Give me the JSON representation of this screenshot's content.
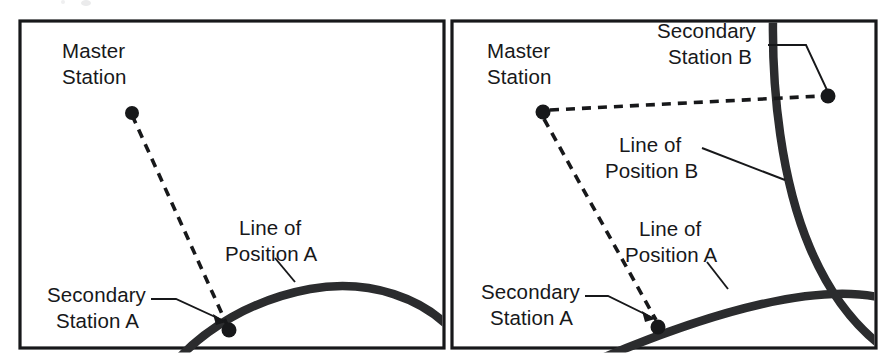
{
  "figure": {
    "title_fragment": "",
    "background_color": "#ffffff",
    "ink_color": "#17181a",
    "panel_border_color": "#17181a",
    "curve_color": "#2b2c2e",
    "dashed_line_color": "#17181a"
  },
  "panels": [
    {
      "id": "panel-left",
      "name": "single-line-of-position",
      "frame": {
        "x": 20,
        "y": 21,
        "width": 424,
        "height": 327
      },
      "labels": [
        {
          "name": "master-station",
          "line1": "Master",
          "line2": "Station",
          "x": 62,
          "y": 58
        },
        {
          "name": "line-of-position-a",
          "line1": "Line of",
          "line2": "Position A",
          "x": 239,
          "y": 235
        },
        {
          "name": "secondary-station-a",
          "line1": "Secondary",
          "line2": "Station A",
          "x": 47,
          "y": 302
        }
      ],
      "stations": [
        {
          "name": "master-station-dot",
          "x": 132,
          "y": 113,
          "r": 7
        },
        {
          "name": "secondary-station-a-dot",
          "x": 229,
          "y": 330,
          "r": 7.5
        }
      ],
      "baselines": [
        {
          "name": "master-to-secondary-a-baseline",
          "x1": 132,
          "y1": 115,
          "x2": 228,
          "y2": 327
        }
      ],
      "position_lines": [
        {
          "name": "line-of-position-a-curve",
          "label": "Line of Position A"
        }
      ],
      "leaders": [
        {
          "name": "leader-line-of-position-a"
        },
        {
          "name": "leader-secondary-station-a"
        }
      ]
    },
    {
      "id": "panel-right",
      "name": "crossed-lines-of-position-fix",
      "frame": {
        "x": 452,
        "y": 21,
        "width": 424,
        "height": 327
      },
      "labels": [
        {
          "name": "master-station",
          "line1": "Master",
          "line2": "Station",
          "x": 487,
          "y": 58
        },
        {
          "name": "secondary-station-b",
          "line1": "Secondary",
          "line2": "Station B",
          "x": 657,
          "y": 38
        },
        {
          "name": "line-of-position-b",
          "line1": "Line of",
          "line2": "Position B",
          "x": 619,
          "y": 152
        },
        {
          "name": "line-of-position-a",
          "line1": "Line of",
          "line2": "Position A",
          "x": 639,
          "y": 236
        },
        {
          "name": "secondary-station-a",
          "line1": "Secondary",
          "line2": "Station A",
          "x": 481,
          "y": 299
        }
      ],
      "stations": [
        {
          "name": "master-station-dot",
          "x": 543,
          "y": 112,
          "r": 7.5
        },
        {
          "name": "secondary-station-a-dot",
          "x": 658,
          "y": 327,
          "r": 7.5
        },
        {
          "name": "secondary-station-b-dot",
          "x": 828,
          "y": 96,
          "r": 7.5
        }
      ],
      "baselines": [
        {
          "name": "master-to-secondary-b-baseline",
          "x1": 546,
          "y1": 111,
          "x2": 822,
          "y2": 96
        },
        {
          "name": "master-to-secondary-a-baseline",
          "x1": 543,
          "y1": 118,
          "x2": 657,
          "y2": 320
        }
      ],
      "position_lines": [
        {
          "name": "line-of-position-a-curve",
          "label": "Line of Position A"
        },
        {
          "name": "line-of-position-b-curve",
          "label": "Line of Position B"
        }
      ],
      "leaders": [
        {
          "name": "leader-secondary-station-b"
        },
        {
          "name": "leader-line-of-position-b"
        },
        {
          "name": "leader-line-of-position-a"
        },
        {
          "name": "leader-secondary-station-a"
        }
      ],
      "intersection": {
        "name": "fix-intersection",
        "x": 838,
        "y": 276
      }
    }
  ]
}
